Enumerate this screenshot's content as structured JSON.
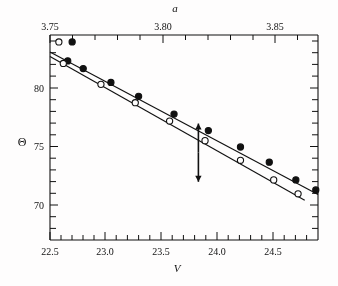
{
  "figure": {
    "background_color": "#ffffff",
    "line_color": "#111111",
    "marker_filled_color": "#111111",
    "marker_open_color": "#ffffff"
  },
  "axes": {
    "top": {
      "label": "a",
      "ticks": [
        "3.75",
        "3.80",
        "3.85"
      ],
      "tick_values": [
        3.75,
        3.8,
        3.85
      ],
      "range": [
        3.7478,
        3.8666
      ],
      "minor_per_major": 5
    },
    "bottom": {
      "label": "V",
      "ticks": [
        "22.5",
        "23.0",
        "23.5",
        "24.0",
        "24.5"
      ],
      "tick_values": [
        22.5,
        23.0,
        23.5,
        24.0,
        24.5
      ],
      "range": [
        22.5,
        24.92
      ],
      "minor_per_major": 5
    },
    "left": {
      "label": "Θ",
      "ticks": [
        "80",
        "75",
        "70"
      ],
      "tick_values": [
        80,
        75,
        70
      ],
      "range": [
        67.4,
        83.6
      ],
      "minor_per_major": 5
    },
    "right": {
      "label": "",
      "ticks": [],
      "minor_per_major": 5
    }
  },
  "annotations": [
    {
      "name": "up-arrow",
      "symbol": "↑",
      "points_to": "filled-series",
      "x": 23.84,
      "y_from": 74.3,
      "y_to": 76.6
    },
    {
      "name": "down-arrow",
      "symbol": "↓",
      "points_to": "open-series",
      "x": 23.84,
      "y_from": 74.3,
      "y_to": 72.0
    }
  ],
  "chart_data": {
    "type": "scatter",
    "title": "",
    "xlabel": "V",
    "ylabel": "Θ",
    "xlabel_secondary": "a",
    "xlim": [
      22.5,
      24.92
    ],
    "ylim": [
      67.4,
      83.6
    ],
    "xlim_secondary": [
      3.7478,
      3.8666
    ],
    "grid": false,
    "legend": "none",
    "series": [
      {
        "name": "filled-circles",
        "marker": "filled-circle",
        "x": [
          22.66,
          22.8,
          23.05,
          23.3,
          23.62,
          23.93,
          24.22,
          24.48,
          24.72,
          24.9
        ],
        "y": [
          81.55,
          80.95,
          79.85,
          78.75,
          77.35,
          76.05,
          74.75,
          73.55,
          72.15,
          71.35
        ],
        "fit_line": {
          "x": [
            22.5,
            24.92
          ],
          "y": [
            82.25,
            71.0
          ]
        }
      },
      {
        "name": "open-circles",
        "marker": "open-circle",
        "x": [
          22.62,
          22.96,
          23.27,
          23.58,
          23.9,
          24.22,
          24.52,
          24.74
        ],
        "y": [
          81.35,
          79.7,
          78.25,
          76.8,
          75.25,
          73.7,
          72.15,
          71.05
        ],
        "fit_line": {
          "x": [
            22.5,
            24.8
          ],
          "y": [
            81.9,
            70.55
          ]
        }
      },
      {
        "name": "outlier-open-circle",
        "marker": "open-circle",
        "x": [
          22.58
        ],
        "y": [
          83.05
        ]
      },
      {
        "name": "outlier-filled-circle",
        "marker": "filled-circle",
        "x": [
          22.7
        ],
        "y": [
          83.05
        ]
      }
    ]
  }
}
